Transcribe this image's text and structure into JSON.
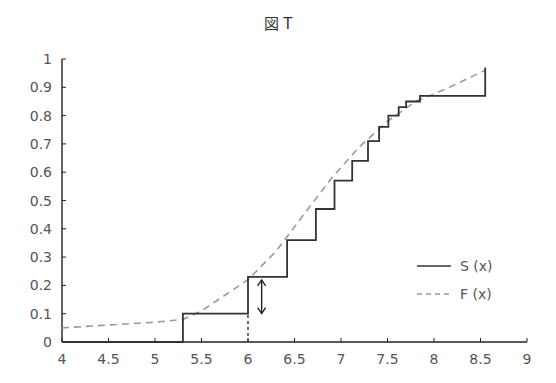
{
  "chart_data": {
    "type": "line",
    "title": "図 T",
    "xlabel": "",
    "ylabel": "",
    "xlim": [
      4,
      9
    ],
    "ylim": [
      0,
      1
    ],
    "x_ticks": [
      "4",
      "4.5",
      "5",
      "5.5",
      "6",
      "6.5",
      "7",
      "7.5",
      "8",
      "8.5",
      "9"
    ],
    "y_ticks": [
      "0",
      "0.1",
      "0.2",
      "0.3",
      "0.4",
      "0.5",
      "0.6",
      "0.7",
      "0.8",
      "0.9",
      "1"
    ],
    "grid": false,
    "legend_position": "lower right",
    "series": [
      {
        "name": "S (x)",
        "style": "solid step",
        "x": [
          4,
          5.3,
          6.0,
          6.42,
          6.73,
          6.93,
          7.12,
          7.29,
          7.41,
          7.51,
          7.62,
          7.7,
          7.85,
          8.55
        ],
        "y": [
          0,
          0.1,
          0.23,
          0.36,
          0.47,
          0.57,
          0.64,
          0.71,
          0.76,
          0.8,
          0.83,
          0.85,
          0.87,
          0.97
        ]
      },
      {
        "name": "F (x)",
        "style": "dashed",
        "x": [
          4.0,
          4.5,
          5.0,
          5.3,
          5.5,
          6.0,
          6.3,
          6.6,
          6.9,
          7.2,
          7.5,
          7.8,
          8.1,
          8.55
        ],
        "y": [
          0.05,
          0.06,
          0.07,
          0.08,
          0.11,
          0.22,
          0.32,
          0.45,
          0.58,
          0.69,
          0.78,
          0.85,
          0.89,
          0.96
        ]
      }
    ],
    "annotations": [
      {
        "type": "double-arrow",
        "x": 6.05,
        "y_from": 0.09,
        "y_to": 0.23,
        "description": "max difference between S(x) and F(x)"
      },
      {
        "type": "dotted-vertical",
        "x": 6.0,
        "y_from": 0,
        "y_to": 0.1
      }
    ]
  },
  "legend": {
    "s_label": "S (x)",
    "f_label": "F (x)"
  }
}
